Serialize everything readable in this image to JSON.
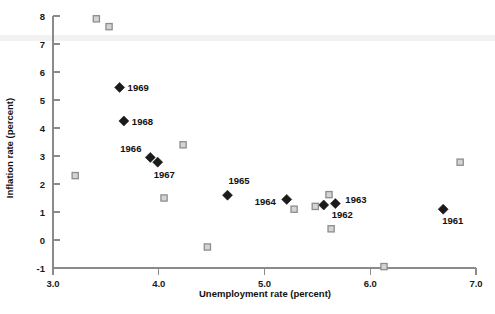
{
  "chart_data": {
    "type": "scatter",
    "title": "",
    "xlabel": "Unemployment rate (percent)",
    "ylabel": "Inflation rate (percent)",
    "xlim": [
      3.0,
      7.0
    ],
    "ylim": [
      -1,
      8
    ],
    "xticks": [
      3.0,
      4.0,
      5.0,
      6.0,
      7.0
    ],
    "xticklabels": [
      "3.0",
      "4.0",
      "5.0",
      "6.0",
      "7.0"
    ],
    "yticks": [
      -1,
      0,
      1,
      2,
      3,
      4,
      5,
      6,
      7,
      8
    ],
    "yticklabels": [
      "-1",
      "0",
      "1",
      "2",
      "3",
      "4",
      "5",
      "6",
      "7",
      "8"
    ],
    "grid": false,
    "legend": "none",
    "series": [
      {
        "name": "labeled-years",
        "marker": "filled-diamond",
        "color": "#1b1b1b",
        "points": [
          {
            "label": "1961",
            "x": 6.69,
            "y": 1.1,
            "label_dx": -1,
            "label_dy": 15
          },
          {
            "label": "1962",
            "x": 5.56,
            "y": 1.25,
            "label_dx": 8,
            "label_dy": 13
          },
          {
            "label": "1963",
            "x": 5.67,
            "y": 1.3,
            "label_dx": 10,
            "label_dy": -1
          },
          {
            "label": "1964",
            "x": 5.21,
            "y": 1.45,
            "label_dx": -32,
            "label_dy": 6
          },
          {
            "label": "1965",
            "x": 4.65,
            "y": 1.6,
            "label_dx": 1,
            "label_dy": -11
          },
          {
            "label": "1966",
            "x": 3.92,
            "y": 2.95,
            "label_dx": -30,
            "label_dy": -5
          },
          {
            "label": "1967",
            "x": 3.99,
            "y": 2.78,
            "label_dx": -4,
            "label_dy": 16
          },
          {
            "label": "1968",
            "x": 3.67,
            "y": 4.25,
            "label_dx": 8,
            "label_dy": 4
          },
          {
            "label": "1969",
            "x": 3.63,
            "y": 5.45,
            "label_dx": 8,
            "label_dy": 4
          }
        ]
      },
      {
        "name": "unlabeled-observations",
        "marker": "open-square",
        "color": "#d4d4d4",
        "points": [
          {
            "x": 3.41,
            "y": 7.9
          },
          {
            "x": 3.53,
            "y": 7.62
          },
          {
            "x": 3.21,
            "y": 2.3
          },
          {
            "x": 4.23,
            "y": 3.4
          },
          {
            "x": 4.05,
            "y": 1.5
          },
          {
            "x": 4.46,
            "y": -0.25
          },
          {
            "x": 5.28,
            "y": 1.1
          },
          {
            "x": 5.61,
            "y": 1.62
          },
          {
            "x": 5.48,
            "y": 1.2
          },
          {
            "x": 5.63,
            "y": 0.4
          },
          {
            "x": 6.13,
            "y": -0.95
          },
          {
            "x": 6.85,
            "y": 2.78
          }
        ]
      }
    ]
  }
}
